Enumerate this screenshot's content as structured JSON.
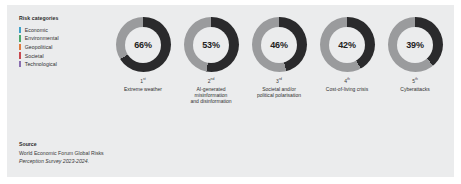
{
  "panel": {
    "background": "#ebeced"
  },
  "legend": {
    "title": "Risk categories",
    "items": [
      {
        "label": "Economic",
        "color": "#3fa0c8"
      },
      {
        "label": "Environmental",
        "color": "#4aa86a"
      },
      {
        "label": "Geopolitical",
        "color": "#e07a3f"
      },
      {
        "label": "Societal",
        "color": "#c8484f"
      },
      {
        "label": "Technological",
        "color": "#8a6fb0"
      }
    ]
  },
  "chart_data": {
    "type": "pie",
    "title": "",
    "subtitle": "",
    "xlabel": "",
    "ylabel": "",
    "legend_position": "left",
    "grid": false,
    "donut_track_color": "#9a9b9d",
    "donut_value_color": "#2a2a2c",
    "series": [
      {
        "name": "Share of respondents",
        "values": [
          66,
          53,
          46,
          42,
          39
        ]
      }
    ],
    "categories": [
      "Extreme weather",
      "AI-generated misinformation and disinformation",
      "Societal and/or political polarisation",
      "Cost-of-living crisis",
      "Cyberattacks"
    ],
    "items": [
      {
        "value": 66,
        "value_label": "66%",
        "rank": "1",
        "rank_suffix": "st",
        "caption": "Extreme weather",
        "category": "Environmental"
      },
      {
        "value": 53,
        "value_label": "53%",
        "rank": "2",
        "rank_suffix": "nd",
        "caption": "AI-generated\nmisinformation\nand disinformation",
        "category": "Technological"
      },
      {
        "value": 46,
        "value_label": "46%",
        "rank": "3",
        "rank_suffix": "rd",
        "caption": "Societal and/or\npolitical polarisation",
        "category": "Societal"
      },
      {
        "value": 42,
        "value_label": "42%",
        "rank": "4",
        "rank_suffix": "th",
        "caption": "Cost-of-living crisis",
        "category": "Economic"
      },
      {
        "value": 39,
        "value_label": "39%",
        "rank": "5",
        "rank_suffix": "th",
        "caption": "Cyberattacks",
        "category": "Technological"
      }
    ]
  },
  "source": {
    "title": "Source",
    "lines": [
      "World Economic Forum Global Risks",
      "Perception Survey 2023-2024."
    ]
  }
}
